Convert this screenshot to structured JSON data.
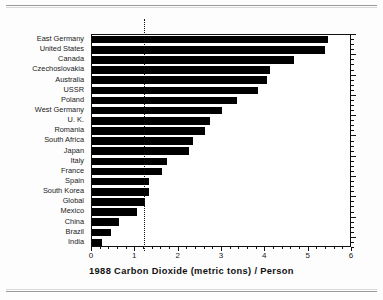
{
  "chart_data": {
    "type": "bar",
    "orientation": "horizontal",
    "title": "1988 Carbon Dioxide (metric tons) / Person",
    "xlabel": "1988 Carbon Dioxide (metric tons) / Person",
    "ylabel": "",
    "xlim": [
      0,
      6
    ],
    "xticks": [
      0,
      1,
      2,
      3,
      4,
      5,
      6
    ],
    "xtick_labels": [
      "0",
      "1",
      "2",
      "3",
      "4",
      "5",
      "6"
    ],
    "grid": false,
    "legend": "none",
    "reference_line": {
      "value": 1.22,
      "style": "dotted",
      "label": "Global average"
    },
    "bar_color": "#000000",
    "categories": [
      "East Germany",
      "United States",
      "Canada",
      "Czechoslovakia",
      "Australia",
      "USSR",
      "Poland",
      "West Germany",
      "U. K.",
      "Romania",
      "South Africa",
      "Japan",
      "Italy",
      "France",
      "Spain",
      "South Korea",
      "Global",
      "Mexico",
      "China",
      "Brazil",
      "India"
    ],
    "values": [
      5.45,
      5.38,
      4.66,
      4.11,
      4.04,
      3.84,
      3.34,
      3.01,
      2.73,
      2.61,
      2.34,
      2.24,
      1.73,
      1.62,
      1.32,
      1.32,
      1.22,
      1.03,
      0.62,
      0.44,
      0.22
    ]
  },
  "axis": {
    "title": "1988 Carbon Dioxide (metric tons) / Person"
  }
}
